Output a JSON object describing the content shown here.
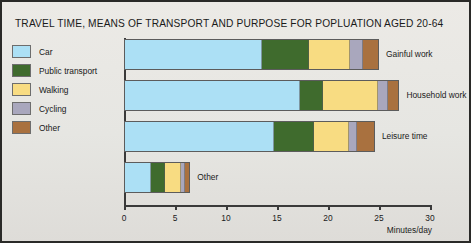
{
  "chart_data": {
    "type": "bar",
    "orientation": "horizontal",
    "stacked": true,
    "title": "TRAVEL TIME, MEANS OF TRANSPORT AND PURPOSE FOR POPLUATION AGED 20-64",
    "xlabel": "Minutes/day",
    "ylabel": "",
    "xlim": [
      0,
      30
    ],
    "xticks": [
      0,
      5,
      10,
      15,
      20,
      25,
      30
    ],
    "xtick_labels": [
      "0",
      "5",
      "10",
      "15",
      "20",
      "25",
      "30"
    ],
    "grid": false,
    "legend_position": "left-outside",
    "categories": [
      "Gainful work",
      "Household work",
      "Leisure time",
      "Other"
    ],
    "series": [
      {
        "name": "Car",
        "color": "#ace0f5",
        "values": [
          13.5,
          17.3,
          14.7,
          2.6
        ]
      },
      {
        "name": "Public transport",
        "color": "#3f6b2d",
        "values": [
          4.6,
          2.2,
          3.9,
          1.4
        ]
      },
      {
        "name": "Walking",
        "color": "#f8dc82",
        "values": [
          4.1,
          5.4,
          3.5,
          1.6
        ]
      },
      {
        "name": "Cycling",
        "color": "#a9a7bd",
        "values": [
          1.2,
          1.0,
          0.7,
          0.4
        ]
      },
      {
        "name": "Other",
        "color": "#a9713f",
        "values": [
          1.6,
          1.1,
          1.8,
          0.5
        ]
      }
    ],
    "totals": [
      25.0,
      27.0,
      24.6,
      6.5
    ]
  },
  "legend": {
    "items": [
      {
        "label": "Car",
        "color": "#ace0f5"
      },
      {
        "label": "Public transport",
        "color": "#3f6b2d"
      },
      {
        "label": "Walking",
        "color": "#f8dc82"
      },
      {
        "label": "Cycling",
        "color": "#a9a7bd"
      },
      {
        "label": "Other",
        "color": "#a9713f"
      }
    ]
  }
}
